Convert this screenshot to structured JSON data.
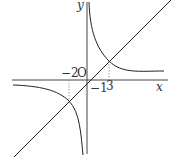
{
  "diagram": {
    "type": "function-graph",
    "axes": {
      "x_label": "x",
      "y_label": "y",
      "origin_label": "O"
    },
    "tick_labels": {
      "x_neg": "−2",
      "x_pos": "3",
      "y_neg": "−1"
    },
    "curves": [
      {
        "name": "line",
        "equation_implied": "y = x - 1",
        "y_intercept": -1
      },
      {
        "name": "hyperbola",
        "branches": 2
      }
    ],
    "intersections_x": [
      -2,
      3
    ],
    "colors": {
      "stroke": "#333333",
      "guide": "#888888",
      "background": "#ffffff"
    }
  }
}
